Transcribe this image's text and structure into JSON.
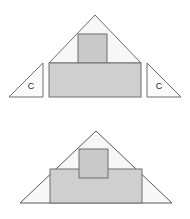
{
  "diagram": {
    "type": "geometric-dissection",
    "colors": {
      "stroke": "#777777",
      "stroke_dark": "#555555",
      "triangle_fill": "#f7f7f7",
      "square_fill": "#c9c9c9",
      "rectangle_fill": "#cfcfcf",
      "corner_fill": "#fbfbfb",
      "label_color": "#2b2b2b",
      "background": "#ffffff"
    },
    "figures": [
      {
        "name": "exploded-figure",
        "description": "Large triangle with inner square and rectangle, with two corner triangles detached to the sides",
        "parts": [
          {
            "name": "main-triangle",
            "shape": "triangle",
            "points": "95,15 49,63 141,63"
          },
          {
            "name": "inner-square",
            "shape": "rectangle",
            "x": 78,
            "y": 34,
            "width": 29,
            "height": 29
          },
          {
            "name": "base-rectangle",
            "shape": "rectangle",
            "x": 49,
            "y": 63,
            "width": 92,
            "height": 34
          },
          {
            "name": "left-corner-triangle",
            "shape": "triangle",
            "points": "43,63 43,97 9,97",
            "label": "C",
            "label_x": 33,
            "label_y": 86
          },
          {
            "name": "right-corner-triangle",
            "shape": "triangle",
            "points": "147,63 147,97 181,97",
            "label": "C",
            "label_x": 157,
            "label_y": 86
          }
        ]
      },
      {
        "name": "assembled-figure",
        "description": "Same triangle with the two corner triangles reattached inside the base",
        "parts": [
          {
            "name": "main-triangle",
            "shape": "triangle",
            "points": "96,131 20,203 172,203"
          },
          {
            "name": "inner-square",
            "shape": "rectangle",
            "x": 79,
            "y": 149,
            "width": 29,
            "height": 29
          },
          {
            "name": "base-rectangle",
            "shape": "rectangle",
            "x": 50,
            "y": 169,
            "width": 92,
            "height": 34
          }
        ]
      }
    ],
    "labels": {
      "corner_piece": "C"
    }
  }
}
